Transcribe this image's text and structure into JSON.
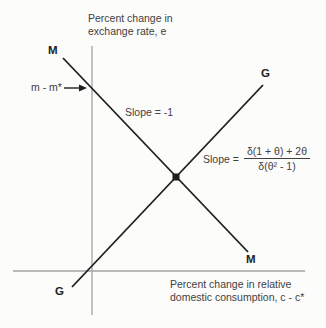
{
  "figure": {
    "axes": {
      "y_label_line1": "Percent change in",
      "y_label_line2": "exchange rate, e",
      "x_label_line1": "Percent change in relative",
      "x_label_line2": "domestic consumption, c - c*"
    },
    "curve_labels": {
      "mm_top": "M",
      "mm_bottom": "M",
      "gg_top": "G",
      "gg_bottom": "G"
    },
    "annotations": {
      "money_shift": "m - m*",
      "mm_slope": "Slope = -1",
      "gg_slope_prefix": "Slope =",
      "gg_slope_numerator": "δ(1 + θ) + 2θ",
      "gg_slope_denominator": "δ(θ² - 1)"
    },
    "colors": {
      "curve": "#1f1f1f",
      "axis": "#a3a3a3",
      "text": "#3f3f3f",
      "background": "#fcfcfb"
    }
  }
}
